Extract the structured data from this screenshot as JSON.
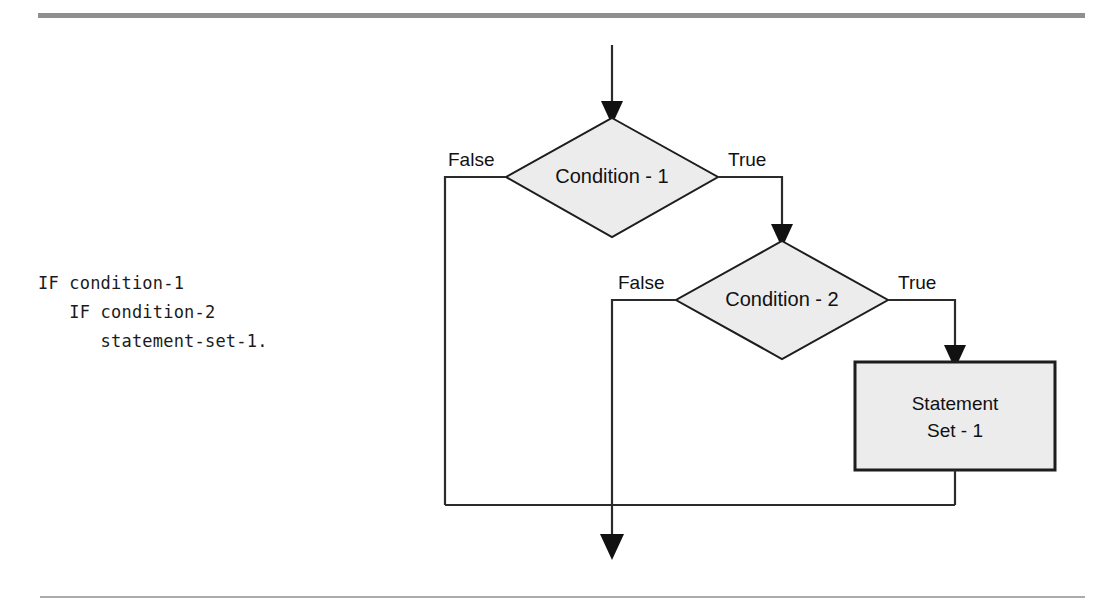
{
  "page": {
    "background_color": "#ffffff",
    "rule_top_color": "#8d8f91",
    "rule_bottom_color": "#a9abad"
  },
  "code_listing": {
    "name": "cobol-nested-if-snippet",
    "line1": "IF condition-1",
    "line2": "   IF condition-2",
    "line3": "      statement-set-1.",
    "text": "IF condition-1\n   IF condition-2\n      statement-set-1."
  },
  "flowchart": {
    "shape_fill": "#ececec",
    "shape_stroke": "#1d1d1d",
    "line_color": "#2b2b2b",
    "nodes": [
      {
        "id": "condition-1",
        "type": "decision",
        "label": "Condition - 1",
        "cx": 612,
        "cy": 177,
        "rx": 106,
        "ry": 60
      },
      {
        "id": "condition-2",
        "type": "decision",
        "label": "Condition - 2",
        "cx": 782,
        "cy": 300,
        "rx": 106,
        "ry": 59
      },
      {
        "id": "statement-set-1",
        "type": "process",
        "label_line1": "Statement",
        "label_line2": "Set - 1",
        "x": 855,
        "y": 362,
        "width": 200,
        "height": 108
      }
    ],
    "edge_labels": [
      {
        "id": "false-1",
        "text": "False",
        "x": 448,
        "y": 162
      },
      {
        "id": "true-1",
        "text": "True",
        "x": 728,
        "y": 162
      },
      {
        "id": "false-2",
        "text": "False",
        "x": 618,
        "y": 285
      },
      {
        "id": "true-2",
        "text": "True",
        "x": 898,
        "y": 285
      }
    ],
    "entry": {
      "id": "entry-arrow",
      "x": 612,
      "y_start": 45,
      "y_end": 118
    },
    "exit": {
      "id": "exit-arrow",
      "x": 612,
      "y_start": 505,
      "y_end": 558
    },
    "merge_line": {
      "id": "merge-bus",
      "y": 505,
      "x_start": 445,
      "x_end": 955
    }
  }
}
